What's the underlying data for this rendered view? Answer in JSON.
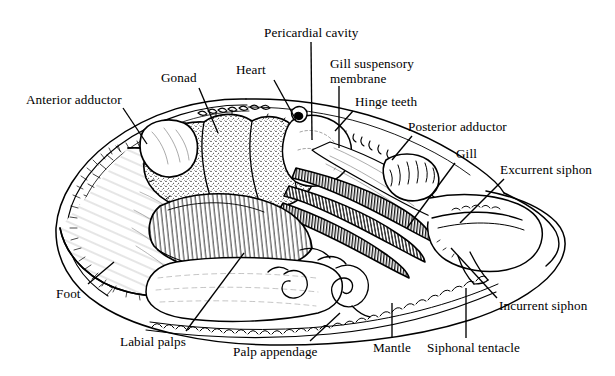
{
  "figure": {
    "type": "line-drawing",
    "background_color": "#ffffff",
    "ink_color": "#000000",
    "width": 615,
    "height": 376
  },
  "labels": [
    {
      "id": "anterior-adductor",
      "text": "Anterior adductor",
      "x": 26,
      "y": 93,
      "align": "left",
      "leader": [
        [
          123,
          108
        ],
        [
          147,
          144
        ]
      ]
    },
    {
      "id": "gonad",
      "text": "Gonad",
      "x": 161,
      "y": 71,
      "align": "left",
      "leader": [
        [
          199,
          88
        ],
        [
          218,
          133
        ]
      ]
    },
    {
      "id": "heart",
      "text": "Heart",
      "x": 236,
      "y": 63,
      "align": "left",
      "leader": [
        [
          274,
          80
        ],
        [
          296,
          120
        ]
      ]
    },
    {
      "id": "pericardial-cavity",
      "text": "Pericardial cavity",
      "x": 264,
      "y": 26,
      "align": "left",
      "leader": [
        [
          311,
          42
        ],
        [
          312,
          140
        ]
      ]
    },
    {
      "id": "gill-suspensory-membrane",
      "text": "Gill suspensory\nmembrane",
      "x": 330,
      "y": 56,
      "align": "left",
      "leader": [
        [
          339,
          86
        ],
        [
          339,
          148
        ]
      ]
    },
    {
      "id": "hinge-teeth",
      "text": "Hinge teeth",
      "x": 355,
      "y": 95,
      "align": "left",
      "leader": [
        [
          353,
          111
        ],
        [
          335,
          131
        ]
      ]
    },
    {
      "id": "posterior-adductor",
      "text": "Posterior adductor",
      "x": 408,
      "y": 120,
      "align": "left",
      "leader": [
        [
          412,
          136
        ],
        [
          392,
          160
        ]
      ]
    },
    {
      "id": "gill",
      "text": "Gill",
      "x": 456,
      "y": 147,
      "align": "left",
      "leader": [
        [
          455,
          163
        ],
        [
          407,
          228
        ]
      ]
    },
    {
      "id": "excurrent-siphon",
      "text": "Excurrent siphon",
      "x": 500,
      "y": 163,
      "align": "left",
      "leader": [
        [
          504,
          179
        ],
        [
          460,
          223
        ]
      ]
    },
    {
      "id": "incurrent-siphon",
      "text": "Incurrent siphon",
      "x": 499,
      "y": 299,
      "align": "left",
      "leader": [
        [
          497,
          298
        ],
        [
          451,
          248
        ]
      ]
    },
    {
      "id": "siphonal-tentacle",
      "text": "Siphonal tentacle",
      "x": 427,
      "y": 341,
      "align": "left",
      "leader": [
        [
          466,
          338
        ],
        [
          466,
          288
        ]
      ]
    },
    {
      "id": "mantle",
      "text": "Mantle",
      "x": 373,
      "y": 341,
      "align": "left",
      "leader": [
        [
          392,
          338
        ],
        [
          392,
          303
        ]
      ]
    },
    {
      "id": "palp-appendage",
      "text": "Palp appendage",
      "x": 233,
      "y": 345,
      "align": "left",
      "leader": [
        [
          310,
          341
        ],
        [
          340,
          313
        ]
      ]
    },
    {
      "id": "labial-palps",
      "text": "Labial palps",
      "x": 120,
      "y": 335,
      "align": "left",
      "leader": [
        [
          186,
          331
        ],
        [
          244,
          253
        ]
      ]
    },
    {
      "id": "foot",
      "text": "Foot",
      "x": 56,
      "y": 287,
      "align": "left",
      "leader": [
        [
          88,
          284
        ],
        [
          114,
          262
        ]
      ]
    }
  ],
  "structures": [
    {
      "id": "shell-valve",
      "name": "Right shell valve outline"
    },
    {
      "id": "hinge-line",
      "name": "Dorsal hinge margin with hinge teeth"
    },
    {
      "id": "anterior-adductor-muscle",
      "name": "Anterior adductor muscle"
    },
    {
      "id": "posterior-adductor-muscle",
      "name": "Posterior adductor muscle"
    },
    {
      "id": "gonad-mass",
      "name": "Gonad (stippled visceral mass)"
    },
    {
      "id": "heart-ventricle",
      "name": "Heart"
    },
    {
      "id": "pericardium",
      "name": "Pericardial cavity"
    },
    {
      "id": "gill-lamellae",
      "name": "Gill (ctenidium) with fine filaments"
    },
    {
      "id": "gill-membrane",
      "name": "Gill suspensory membrane"
    },
    {
      "id": "labial-palp-fan",
      "name": "Labial palps with radiating ridges"
    },
    {
      "id": "foot-mass",
      "name": "Foot"
    },
    {
      "id": "mantle-edge",
      "name": "Scalloped mantle margin"
    },
    {
      "id": "siphon-pair",
      "name": "Incurrent and excurrent siphons"
    },
    {
      "id": "palp-appendage-coil",
      "name": "Coiled palp appendage"
    }
  ]
}
